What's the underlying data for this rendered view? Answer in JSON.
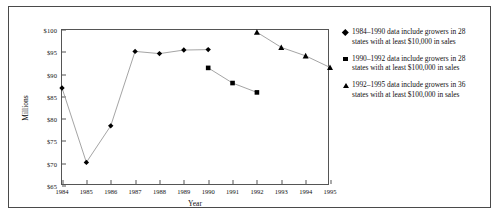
{
  "chart_data": {
    "type": "line",
    "title": "",
    "xlabel": "Year",
    "ylabel": "Millions",
    "x": [
      1984,
      1985,
      1986,
      1987,
      1988,
      1989,
      1990,
      1991,
      1992,
      1993,
      1994,
      1995
    ],
    "xtick_labels": [
      "1984",
      "1985",
      "1986",
      "1987",
      "1988",
      "1989",
      "1990",
      "1991",
      "1992",
      "1993",
      "1994",
      "1995"
    ],
    "ytick_labels": [
      "$100",
      "$95",
      "$90",
      "$85",
      "$80",
      "$75",
      "$70",
      "$65"
    ],
    "ytick_values": [
      100,
      95,
      90,
      85,
      80,
      75,
      70,
      65
    ],
    "xlim": [
      1984,
      1995
    ],
    "ylim": [
      65,
      100
    ],
    "grid": false,
    "legend_position": "right",
    "series": [
      {
        "name": "1984–1990 data include growers in 28 states with at least $10,000 in sales",
        "marker": "diamond",
        "x": [
          1984,
          1985,
          1986,
          1987,
          1988,
          1989,
          1990
        ],
        "values": [
          87.0,
          70.3,
          78.5,
          95.2,
          94.7,
          95.5,
          95.6
        ]
      },
      {
        "name": "1990–1992 data include growers in 28 states with at least $100,000 in sales",
        "marker": "square",
        "x": [
          1990,
          1991,
          1992
        ],
        "values": [
          91.5,
          88.1,
          86.0
        ]
      },
      {
        "name": "1992–1995 data include growers in 36 states with at least $100,000 in sales",
        "marker": "triangle",
        "x": [
          1992,
          1993,
          1994,
          1995
        ],
        "values": [
          99.5,
          96.1,
          94.2,
          91.6
        ]
      }
    ]
  },
  "axes": {
    "y_title": "Millions",
    "x_title": "Year",
    "y_ticks": [
      "$100",
      "$95",
      "$90",
      "$85",
      "$80",
      "$75",
      "$70",
      "$65"
    ],
    "x_ticks": [
      "1984",
      "1985",
      "1986",
      "1987",
      "1988",
      "1989",
      "1990",
      "1991",
      "1992",
      "1993",
      "1994",
      "1995"
    ]
  },
  "legend": {
    "items": [
      {
        "marker": "diamond-marker",
        "line1": "1984–1990 data include growers in 28",
        "line2": "states with at least $10,000 in sales"
      },
      {
        "marker": "square-marker",
        "line1": "1990–1992 data include growers in 28",
        "line2": "states with at least $100,000 in sales"
      },
      {
        "marker": "triangle-marker",
        "line1": "1992–1995 data include growers in 36",
        "line2": "states with at least $100,000 in sales"
      }
    ]
  },
  "colors": {
    "series": "#000000",
    "line": "#9a9a9a",
    "axis": "#555555",
    "frame": "#4a4a4a",
    "text": "#111111",
    "background": "#ffffff"
  }
}
